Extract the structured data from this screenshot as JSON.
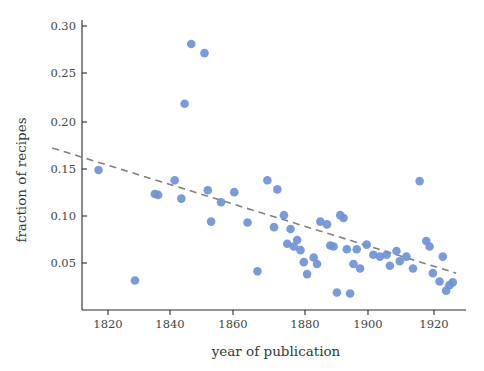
{
  "chart_data": {
    "type": "scatter",
    "title": "",
    "xlabel": "year of publication",
    "ylabel": "fraction of recipes",
    "xlim": [
      1810,
      1926
    ],
    "ylim": [
      0.0,
      0.315
    ],
    "xticks": [
      1820,
      1840,
      1860,
      1880,
      1900,
      1920
    ],
    "xtick_labels": [
      "1820",
      "1840",
      "1860",
      "1880",
      "1900",
      "1920"
    ],
    "yticks": [
      0.05,
      0.1,
      0.15,
      0.2,
      0.25,
      0.3
    ],
    "ytick_labels": [
      "0.05",
      "0.10",
      "0.15",
      "0.20",
      "0.25",
      "0.30"
    ],
    "grid": false,
    "legend": false,
    "marker_color": "#6f92d8",
    "trend_color": "#808080",
    "trend_style": "dashed",
    "series": [
      {
        "name": "recipes",
        "x": [
          1815,
          1826,
          1832,
          1833,
          1838,
          1840,
          1841,
          1843,
          1847,
          1848,
          1849,
          1852,
          1856,
          1860,
          1863,
          1866,
          1868,
          1869,
          1871,
          1872,
          1873,
          1874,
          1875,
          1876,
          1877,
          1878,
          1880,
          1881,
          1882,
          1884,
          1885,
          1886,
          1887,
          1888,
          1889,
          1890,
          1891,
          1892,
          1893,
          1894,
          1896,
          1898,
          1900,
          1902,
          1903,
          1905,
          1906,
          1908,
          1910,
          1912,
          1914,
          1915,
          1916,
          1918,
          1919,
          1920,
          1921,
          1922
        ],
        "y": [
          0.152,
          0.032,
          0.126,
          0.125,
          0.141,
          0.121,
          0.224,
          0.289,
          0.279,
          0.13,
          0.096,
          0.117,
          0.128,
          0.095,
          0.042,
          0.141,
          0.09,
          0.131,
          0.103,
          0.072,
          0.088,
          0.069,
          0.076,
          0.065,
          0.052,
          0.039,
          0.057,
          0.05,
          0.096,
          0.093,
          0.07,
          0.069,
          0.019,
          0.103,
          0.1,
          0.066,
          0.018,
          0.05,
          0.066,
          0.045,
          0.071,
          0.06,
          0.058,
          0.06,
          0.048,
          0.064,
          0.053,
          0.058,
          0.045,
          0.14,
          0.075,
          0.069,
          0.04,
          0.031,
          0.058,
          0.021,
          0.027,
          0.03
        ]
      }
    ],
    "trend": {
      "x_start": 1801,
      "y_start": 0.176,
      "x_end": 1923,
      "y_end": 0.04
    }
  }
}
